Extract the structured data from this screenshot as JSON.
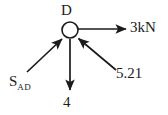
{
  "diagram": {
    "title_node": "D",
    "type": "free-body-diagram",
    "background_color": "#ffffff",
    "stroke_color": "#1b1b1b",
    "node": {
      "label": "D",
      "shape": "circle",
      "center_x": 70,
      "center_y": 30,
      "radius": 8
    },
    "forces": [
      {
        "id": "force-right",
        "label": "3kN",
        "direction": "right",
        "arrow_points": "away-from-node",
        "from_x": 78,
        "from_y": 29,
        "to_x": 128,
        "to_y": 29
      },
      {
        "id": "force-down",
        "label": "4",
        "direction": "down",
        "arrow_points": "away-from-node",
        "from_x": 70,
        "from_y": 39,
        "to_x": 70,
        "to_y": 92
      },
      {
        "id": "force-diagonal-right",
        "label": "5.21",
        "direction": "up-left",
        "arrow_points": "toward-node",
        "from_x": 116,
        "from_y": 70,
        "to_x": 77,
        "to_y": 37
      },
      {
        "id": "member-ad",
        "label_main": "S",
        "label_sub": "AD",
        "direction": "up-right",
        "arrow_points": "toward-node",
        "from_x": 27,
        "from_y": 72,
        "to_x": 63,
        "to_y": 38
      }
    ]
  }
}
